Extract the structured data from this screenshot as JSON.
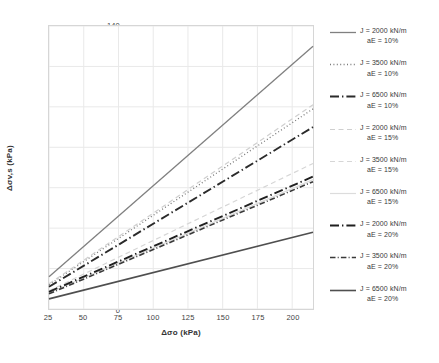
{
  "chart_data": {
    "type": "line",
    "title": "",
    "xlabel": "Δσo (kPa)",
    "ylabel": "Δσv,s (kPa)",
    "xlim": [
      25,
      215
    ],
    "ylim": [
      0,
      140
    ],
    "xticks": [
      25,
      50,
      75,
      100,
      125,
      150,
      175,
      200
    ],
    "yticks": [
      0,
      20,
      40,
      60,
      80,
      100,
      120,
      140
    ],
    "grid": true,
    "legend_position": "right",
    "x": [
      25,
      215
    ],
    "series": [
      {
        "name": "J = 2000 kN/m aE = 10%",
        "J": "2000",
        "aE": "10%",
        "values": [
          16.0,
          130.0
        ],
        "color": "#808080",
        "style": "solid",
        "width": 1.3
      },
      {
        "name": "J = 3500 kN/m aE = 10%",
        "J": "3500",
        "aE": "10%",
        "values": [
          12.0,
          99.0
        ],
        "color": "#7a7a7a",
        "style": "dotted",
        "width": 1.3
      },
      {
        "name": "J = 6500 kN/m aE = 10%",
        "J": "6500",
        "aE": "10%",
        "values": [
          11.0,
          90.0
        ],
        "color": "#2b2b2b",
        "style": "dashdot",
        "width": 1.9
      },
      {
        "name": "J = 2000 kN/m aE = 15%",
        "J": "2000",
        "aE": "15%",
        "values": [
          12.5,
          101.0
        ],
        "color": "#cfcfcf",
        "style": "dashed",
        "width": 1.2
      },
      {
        "name": "J = 3500 kN/m aE = 15%",
        "J": "3500",
        "aE": "15%",
        "values": [
          9.0,
          72.0
        ],
        "color": "#d6d6d6",
        "style": "dashed",
        "width": 1.2
      },
      {
        "name": "J = 6500 kN/m aE = 15%",
        "J": "6500",
        "aE": "15%",
        "values": [
          8.0,
          64.0
        ],
        "color": "#dcdcdc",
        "style": "solid",
        "width": 1.2
      },
      {
        "name": "J = 2000 kN/m aE = 20%",
        "J": "2000",
        "aE": "20%",
        "values": [
          8.5,
          65.5
        ],
        "color": "#1f1f1f",
        "style": "dashdot",
        "width": 1.9
      },
      {
        "name": "J = 3500 kN/m aE = 20%",
        "J": "3500",
        "aE": "20%",
        "values": [
          7.5,
          63.0
        ],
        "color": "#3a3a3a",
        "style": "dashdot-fine",
        "width": 1.6
      },
      {
        "name": "J = 6500 kN/m aE = 20%",
        "J": "6500",
        "aE": "20%",
        "values": [
          5.0,
          38.0
        ],
        "color": "#4f4f4f",
        "style": "solid",
        "width": 1.6
      }
    ]
  },
  "legend": {
    "items": [
      {
        "line1": "J = 2000 kN/m",
        "line2": "aE = 10%"
      },
      {
        "line1": "J = 3500 kN/m",
        "line2": "aE = 10%"
      },
      {
        "line1": "J = 6500 kN/m",
        "line2": "aE = 10%"
      },
      {
        "line1": "J = 2000 kN/m",
        "line2": "aE = 15%"
      },
      {
        "line1": "J = 3500 kN/m",
        "line2": "aE = 15%"
      },
      {
        "line1": "J = 6500 kN/m",
        "line2": "aE = 15%"
      },
      {
        "line1": "J = 2000 kN/m",
        "line2": "aE = 20%"
      },
      {
        "line1": "J = 3500 kN/m",
        "line2": "aE = 20%"
      },
      {
        "line1": "J = 6500 kN/m",
        "line2": "aE = 20%"
      }
    ]
  },
  "axes": {
    "yticklabels": [
      "140",
      "120",
      "100",
      "80",
      "60",
      "40",
      "20",
      "0"
    ],
    "xticklabels": [
      "25",
      "50",
      "75",
      "100",
      "125",
      "150",
      "175",
      "200"
    ]
  },
  "colors": {
    "grid": "#e9e9e9",
    "frame": "#d6d6d6",
    "text": "#3f3f3f"
  }
}
